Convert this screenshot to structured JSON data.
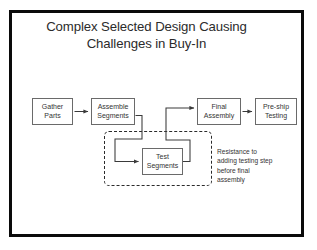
{
  "slide": {
    "title_line1": "Complex Selected Design Causing",
    "title_line2": "Challenges in Buy-In",
    "frame_color": "#0a0a0a",
    "background_color": "#ffffff",
    "text_color": "#343434"
  },
  "flowchart": {
    "nodes": [
      {
        "id": "gather",
        "line1": "Gather",
        "line2": "Parts"
      },
      {
        "id": "assemble",
        "line1": "Assemble",
        "line2": "Segments"
      },
      {
        "id": "test",
        "line1": "Test",
        "line2": "Segments"
      },
      {
        "id": "final",
        "line1": "Final",
        "line2": "Assembly"
      },
      {
        "id": "preship",
        "line1": "Pre-ship",
        "line2": "Testing"
      }
    ],
    "annotation": {
      "line1": "Resistance to",
      "line2": "adding testing step",
      "line3": "before final",
      "line4": "assembly"
    }
  }
}
